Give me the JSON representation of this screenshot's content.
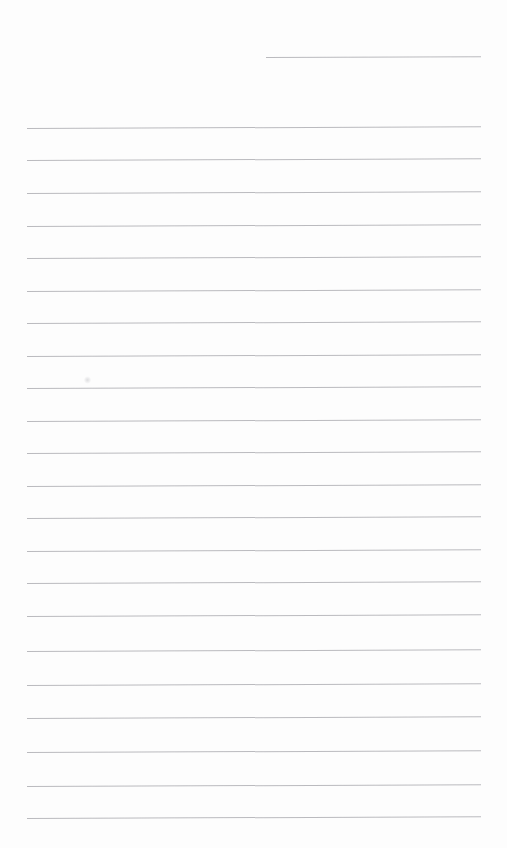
{
  "document": {
    "kind": "scanned-lined-paper",
    "title": "Blank ruled notepad page",
    "page_width": 507,
    "page_height": 848,
    "background_color": "#fdfdfd",
    "rule_color": "#b6b6ba",
    "rule_thickness_px": 1,
    "skew_degrees": -0.22,
    "text_content": "",
    "handwriting_present": false,
    "margin_left_px": 27,
    "margin_right_px": 481,
    "line_spacing_px": 32.4,
    "line_count": 23
  },
  "rules": [
    {
      "id": "rule-1",
      "x": 266,
      "y": 57,
      "width": 215,
      "partial": true,
      "label": "partial-rule-top-right"
    },
    {
      "id": "rule-2",
      "x": 27,
      "y": 128,
      "width": 454,
      "partial": false,
      "label": "rule"
    },
    {
      "id": "rule-3",
      "x": 27,
      "y": 160,
      "width": 454,
      "partial": false,
      "label": "rule"
    },
    {
      "id": "rule-4",
      "x": 27,
      "y": 193,
      "width": 454,
      "partial": false,
      "label": "rule"
    },
    {
      "id": "rule-5",
      "x": 27,
      "y": 226,
      "width": 454,
      "partial": false,
      "label": "rule"
    },
    {
      "id": "rule-6",
      "x": 27,
      "y": 258,
      "width": 454,
      "partial": false,
      "label": "rule"
    },
    {
      "id": "rule-7",
      "x": 27,
      "y": 291,
      "width": 454,
      "partial": false,
      "label": "rule"
    },
    {
      "id": "rule-8",
      "x": 27,
      "y": 323,
      "width": 454,
      "partial": false,
      "label": "rule"
    },
    {
      "id": "rule-9",
      "x": 27,
      "y": 356,
      "width": 454,
      "partial": false,
      "label": "rule"
    },
    {
      "id": "rule-10",
      "x": 27,
      "y": 388,
      "width": 454,
      "partial": false,
      "label": "rule"
    },
    {
      "id": "rule-11",
      "x": 27,
      "y": 421,
      "width": 454,
      "partial": false,
      "label": "rule"
    },
    {
      "id": "rule-12",
      "x": 27,
      "y": 453,
      "width": 454,
      "partial": false,
      "label": "rule"
    },
    {
      "id": "rule-13",
      "x": 27,
      "y": 486,
      "width": 454,
      "partial": false,
      "label": "rule"
    },
    {
      "id": "rule-14",
      "x": 27,
      "y": 518,
      "width": 454,
      "partial": false,
      "label": "rule"
    },
    {
      "id": "rule-15",
      "x": 27,
      "y": 551,
      "width": 454,
      "partial": false,
      "label": "rule"
    },
    {
      "id": "rule-16",
      "x": 27,
      "y": 583,
      "width": 454,
      "partial": false,
      "label": "rule"
    },
    {
      "id": "rule-17",
      "x": 27,
      "y": 616,
      "width": 454,
      "partial": false,
      "label": "rule"
    },
    {
      "id": "rule-18",
      "x": 27,
      "y": 651,
      "width": 454,
      "partial": false,
      "label": "rule"
    },
    {
      "id": "rule-19",
      "x": 27,
      "y": 685,
      "width": 454,
      "partial": false,
      "label": "rule"
    },
    {
      "id": "rule-20",
      "x": 27,
      "y": 718,
      "width": 454,
      "partial": false,
      "label": "rule"
    },
    {
      "id": "rule-21",
      "x": 27,
      "y": 752,
      "width": 454,
      "partial": false,
      "label": "rule"
    },
    {
      "id": "rule-22",
      "x": 27,
      "y": 786,
      "width": 454,
      "partial": false,
      "label": "rule"
    },
    {
      "id": "rule-23",
      "x": 27,
      "y": 818,
      "width": 454,
      "partial": false,
      "label": "rule"
    }
  ],
  "artifacts": [
    {
      "id": "smudge-1",
      "x": 84,
      "y": 376,
      "label": "faint-scan-smudge"
    }
  ]
}
